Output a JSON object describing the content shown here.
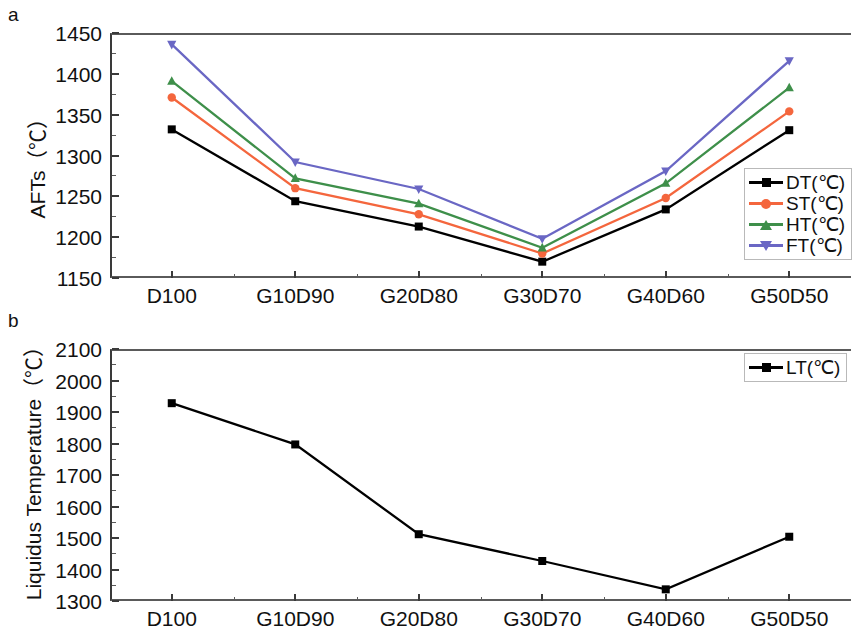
{
  "figure": {
    "panel_a_letter": "a",
    "panel_b_letter": "b"
  },
  "chart_data": [
    {
      "type": "line",
      "panel": "a",
      "title": "",
      "xlabel": "",
      "ylabel": "AFTs（℃）",
      "categories": [
        "D100",
        "G10D90",
        "G20D80",
        "G30D70",
        "G40D60",
        "G50D50"
      ],
      "ylim": [
        1150,
        1450
      ],
      "yticks": [
        1150,
        1200,
        1250,
        1300,
        1350,
        1400,
        1450
      ],
      "ytick_labels": [
        "1150",
        "1200",
        "1250",
        "1300",
        "1350",
        "1400",
        "1450"
      ],
      "grid": false,
      "legend_position": "right-bottom-inside",
      "series": [
        {
          "name": "DT(℃)",
          "color": "#000000",
          "marker": "square",
          "values": [
            1332,
            1244,
            1213,
            1170,
            1234,
            1331
          ]
        },
        {
          "name": "ST(℃)",
          "color": "#F4663D",
          "marker": "circle",
          "values": [
            1371,
            1260,
            1228,
            1180,
            1248,
            1354
          ]
        },
        {
          "name": "HT(℃)",
          "color": "#3E8F4A",
          "marker": "triangle-up",
          "values": [
            1391,
            1272,
            1241,
            1187,
            1266,
            1383
          ]
        },
        {
          "name": "FT(℃)",
          "color": "#6A67C4",
          "marker": "triangle-down",
          "values": [
            1436,
            1292,
            1259,
            1198,
            1281,
            1416
          ]
        }
      ]
    },
    {
      "type": "line",
      "panel": "b",
      "title": "",
      "xlabel": "",
      "ylabel": "Liquidus Temperature（℃）",
      "categories": [
        "D100",
        "G10D90",
        "G20D80",
        "G30D70",
        "G40D60",
        "G50D50"
      ],
      "ylim": [
        1300,
        2100
      ],
      "yticks": [
        1300,
        1400,
        1500,
        1600,
        1700,
        1800,
        1900,
        2000,
        2100
      ],
      "ytick_labels": [
        "1300",
        "1400",
        "1500",
        "1600",
        "1700",
        "1800",
        "1900",
        "2000",
        "2100"
      ],
      "grid": false,
      "legend_position": "right-top-inside",
      "series": [
        {
          "name": "LT(℃)",
          "color": "#000000",
          "marker": "square",
          "values": [
            1928,
            1797,
            1512,
            1427,
            1337,
            1504
          ]
        }
      ]
    }
  ]
}
